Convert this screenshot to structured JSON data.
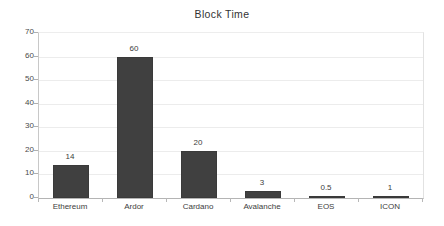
{
  "chart_data": {
    "type": "bar",
    "title": "Block Time",
    "xlabel": "",
    "ylabel": "",
    "categories": [
      "Ethereum",
      "Ardor",
      "Cardano",
      "Avalanche",
      "EOS",
      "ICON"
    ],
    "values": [
      14,
      60,
      20,
      3,
      0.5,
      1
    ],
    "value_labels": [
      "14",
      "60",
      "20",
      "3",
      "0.5",
      "1"
    ],
    "ylim": [
      0,
      70
    ],
    "yticks": [
      0,
      10,
      20,
      30,
      40,
      50,
      60,
      70
    ],
    "ytick_labels": [
      "0",
      "10",
      "20",
      "30",
      "40",
      "50",
      "60",
      "70"
    ],
    "grid": true,
    "legend": false,
    "bar_color": "#404040",
    "gridline_color": "#ececec",
    "axis_color": "#b4b4b4",
    "background_color": "#ffffff",
    "text_color": "#3d3d3d"
  }
}
